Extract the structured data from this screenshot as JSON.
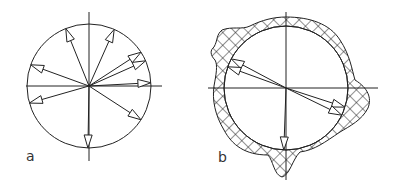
{
  "panels": [
    {
      "label": "a",
      "description": "Uniform distribution of arrows (vectors) radiating from the center of a circle",
      "center": [
        89,
        86
      ],
      "radius": 62,
      "arrow_angles_deg": [
        -112,
        -66,
        -33,
        -24,
        -3,
        164,
        200,
        33,
        91
      ]
    },
    {
      "label": "b",
      "description": "Circle with a cross-hatched band of varying thickness; arrows clustered in a few directions",
      "center": [
        286,
        88
      ],
      "radius": 62,
      "arrow_angles_deg": [
        -152,
        -160,
        18,
        26,
        92
      ]
    }
  ],
  "colors": {
    "stroke": "#222222",
    "background": "#ffffff"
  }
}
